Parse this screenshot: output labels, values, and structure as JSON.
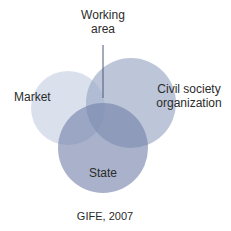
{
  "diagram": {
    "type": "venn",
    "sets": [
      {
        "id": "market",
        "label": "Market",
        "cx": 68,
        "cy": 108,
        "r": 37,
        "color": "#d3dcea"
      },
      {
        "id": "civil",
        "label": "Civil society organization",
        "label_line1": "Civil society",
        "label_line2": "organization",
        "cx": 131,
        "cy": 103,
        "r": 45,
        "color": "#b4bfd4"
      },
      {
        "id": "state",
        "label": "State",
        "cx": 103,
        "cy": 148,
        "r": 45,
        "color": "#8b98b8"
      }
    ],
    "pointer": {
      "label": "Working area",
      "label_line1": "Working",
      "label_line2": "area",
      "x": 103,
      "y1": 45,
      "y2": 98,
      "color": "#4a5578"
    },
    "caption": "GIFE, 2007"
  }
}
